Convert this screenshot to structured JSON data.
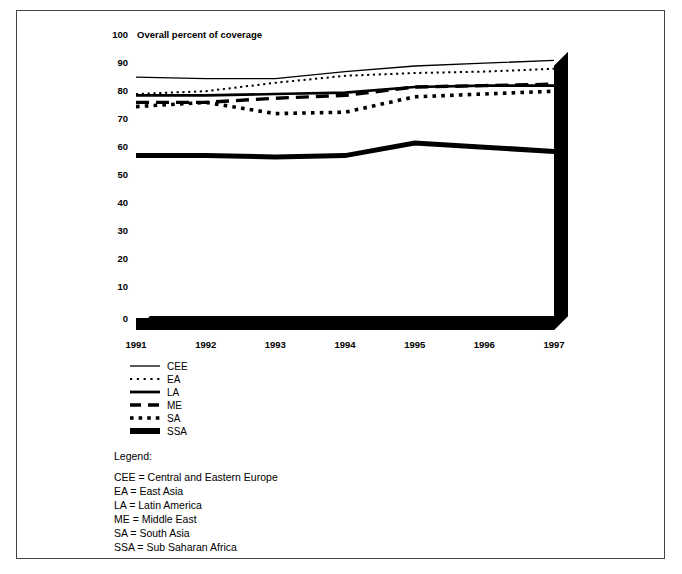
{
  "figure": {
    "border_color": "#444444",
    "background": "#ffffff",
    "ink_color": "#000000"
  },
  "chart_data": {
    "type": "line",
    "title": "Overall percent of coverage",
    "xlabel": "",
    "ylabel": "",
    "x": [
      "1991",
      "1992",
      "1993",
      "1994",
      "1995",
      "1996",
      "1997"
    ],
    "xlim": [
      1991,
      1997
    ],
    "ylim": [
      0,
      100
    ],
    "yticks": [
      0,
      10,
      20,
      30,
      40,
      50,
      60,
      70,
      80,
      90,
      100
    ],
    "grid": false,
    "legend_position": "below-axes-left",
    "style": "3d-floor-and-right-wall",
    "series": [
      {
        "name": "CEE",
        "style": "thin-solid",
        "values": [
          86,
          85.5,
          85.5,
          88,
          90,
          91,
          92
        ]
      },
      {
        "name": "EA",
        "style": "fine-dotted",
        "values": [
          80,
          81,
          84,
          86.5,
          87.5,
          88,
          89
        ]
      },
      {
        "name": "LA",
        "style": "medium-solid",
        "values": [
          79.5,
          79.5,
          80,
          80.5,
          82.5,
          83,
          83
        ]
      },
      {
        "name": "ME",
        "style": "dashed",
        "values": [
          77,
          77,
          78.5,
          79.5,
          82.5,
          83,
          83.5
        ]
      },
      {
        "name": "SA",
        "style": "thick-dotted",
        "values": [
          75.5,
          77,
          73,
          73.5,
          79,
          80,
          81
        ]
      },
      {
        "name": "SSA",
        "style": "very-thick-solid",
        "values": [
          58,
          58,
          57.5,
          58,
          62.5,
          61,
          59.5
        ]
      }
    ]
  },
  "legend": {
    "entries": [
      {
        "key": "CEE",
        "label": "CEE"
      },
      {
        "key": "EA",
        "label": "EA"
      },
      {
        "key": "LA",
        "label": "LA"
      },
      {
        "key": "ME",
        "label": "ME"
      },
      {
        "key": "SA",
        "label": "SA"
      },
      {
        "key": "SSA",
        "label": "SSA"
      }
    ]
  },
  "notes": {
    "heading": "Legend:",
    "lines": [
      "CEE = Central and Eastern Europe",
      "EA = East Asia",
      "LA = Latin America",
      "ME = Middle East",
      "SA = South Asia",
      "SSA = Sub Saharan Africa"
    ]
  }
}
